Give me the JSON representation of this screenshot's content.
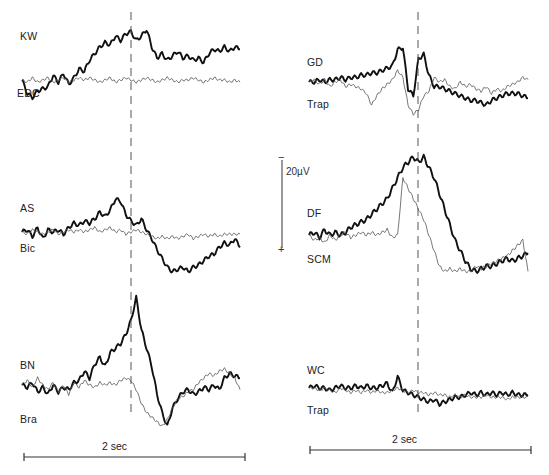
{
  "chart_data": {
    "type": "line",
    "title": "",
    "scale_bar": {
      "amplitude_label": "20µV",
      "polarity_top": "−",
      "polarity_bottom": "+",
      "time_label": "2 sec",
      "time_seconds": 2
    },
    "panels": [
      {
        "column": "left",
        "subject": "KW",
        "reference": "EDC",
        "series": [
          {
            "name": "KW",
            "style": "thick",
            "values": [
              0,
              -6,
              -8,
              -5,
              -4,
              -3,
              2,
              -1,
              3,
              -2,
              1,
              5,
              4,
              9,
              12,
              15,
              17,
              16,
              20,
              18,
              21,
              22,
              18,
              20,
              23,
              15,
              10,
              12,
              9,
              11,
              13,
              10,
              11,
              9,
              10,
              8,
              12,
              14,
              13,
              15,
              13,
              15,
              14
            ]
          },
          {
            "name": "EDC",
            "style": "thin",
            "values": [
              0,
              -1,
              1,
              -1,
              0,
              1,
              -1,
              0,
              1,
              -1,
              0,
              1,
              0,
              1,
              0,
              -1,
              0,
              1,
              -1,
              0,
              1,
              0,
              -1,
              0,
              1,
              0,
              -1,
              0,
              1,
              0,
              -1,
              0,
              0,
              1,
              0,
              -1,
              0,
              1,
              0,
              0,
              -1,
              0,
              -1
            ]
          }
        ]
      },
      {
        "column": "left",
        "subject": "AS",
        "reference": "Bic",
        "series": [
          {
            "name": "AS",
            "style": "thick",
            "values": [
              0,
              1,
              -2,
              2,
              -3,
              1,
              0,
              1,
              -1,
              2,
              4,
              3,
              5,
              4,
              6,
              9,
              7,
              10,
              15,
              14,
              8,
              5,
              3,
              6,
              1,
              -3,
              -8,
              -12,
              -16,
              -18,
              -17,
              -16,
              -18,
              -16,
              -15,
              -13,
              -11,
              -10,
              -7,
              -5,
              -6,
              -3,
              -7
            ]
          },
          {
            "name": "Bic",
            "style": "thin",
            "values": [
              0,
              -1,
              1,
              0,
              -1,
              0,
              1,
              -1,
              0,
              1,
              0,
              1,
              0,
              1,
              2,
              0,
              1,
              2,
              0,
              1,
              -1,
              0,
              1,
              0,
              -1,
              -2,
              -3,
              -2,
              -3,
              -2,
              -3,
              -2,
              -1,
              -3,
              -2,
              -1,
              -2,
              -1,
              -2,
              -1,
              -1,
              -1,
              -1
            ]
          }
        ]
      },
      {
        "column": "left",
        "subject": "BN",
        "reference": "Bra",
        "series": [
          {
            "name": "BN",
            "style": "thick",
            "values": [
              0,
              -1,
              1,
              -3,
              -1,
              -4,
              0,
              -3,
              -1,
              -2,
              1,
              2,
              6,
              3,
              9,
              12,
              8,
              14,
              16,
              18,
              22,
              28,
              38,
              24,
              16,
              8,
              -4,
              -12,
              -18,
              -10,
              -6,
              -3,
              -2,
              -4,
              -3,
              -1,
              -2,
              0,
              -2,
              3,
              5,
              4,
              3
            ]
          },
          {
            "name": "Bra",
            "style": "thin",
            "values": [
              0,
              2,
              -1,
              3,
              0,
              -2,
              1,
              -3,
              0,
              -4,
              1,
              -1,
              2,
              0,
              -1,
              1,
              0,
              1,
              0,
              2,
              3,
              2,
              -2,
              -8,
              -12,
              -14,
              -16,
              -18,
              -15,
              -10,
              -6,
              -5,
              -3,
              -2,
              1,
              3,
              5,
              4,
              6,
              7,
              5,
              3,
              -2
            ]
          }
        ]
      },
      {
        "column": "right",
        "subject": "GD",
        "reference": "Trap",
        "series": [
          {
            "name": "GD",
            "style": "thick",
            "values": [
              0,
              0,
              1,
              0,
              1,
              1,
              2,
              1,
              2,
              2,
              3,
              3,
              4,
              4,
              5,
              6,
              7,
              14,
              15,
              -3,
              -6,
              10,
              12,
              3,
              -2,
              -2,
              -3,
              -4,
              -5,
              -6,
              -7,
              -8,
              -8,
              -9,
              -10,
              -8,
              -7,
              -6,
              -5,
              -5,
              -5,
              -6,
              -7
            ]
          },
          {
            "name": "Trap",
            "style": "thin",
            "values": [
              0,
              1,
              -1,
              1,
              -2,
              0,
              1,
              -2,
              -1,
              -2,
              -3,
              -5,
              -10,
              -6,
              -3,
              -1,
              1,
              5,
              2,
              -10,
              -14,
              -12,
              -6,
              -4,
              2,
              0,
              1,
              -2,
              -3,
              0,
              -2,
              -1,
              -3,
              -4,
              -2,
              -5,
              -3,
              -4,
              -2,
              -1,
              0,
              2,
              1
            ]
          }
        ]
      },
      {
        "column": "right",
        "subject": "DF",
        "reference": "SCM",
        "series": [
          {
            "name": "DF",
            "style": "thick",
            "values": [
              0,
              1,
              -1,
              2,
              0,
              1,
              0,
              1,
              3,
              4,
              5,
              6,
              8,
              10,
              12,
              14,
              18,
              22,
              26,
              28,
              30,
              28,
              30,
              26,
              22,
              16,
              10,
              4,
              -2,
              -6,
              -10,
              -13,
              -14,
              -13,
              -12,
              -12,
              -11,
              -10,
              -9,
              -10,
              -9,
              -8,
              -7
            ]
          },
          {
            "name": "SCM",
            "style": "thin",
            "values": [
              0,
              -2,
              -1,
              -3,
              0,
              -2,
              0,
              1,
              -1,
              0,
              1,
              0,
              1,
              0,
              1,
              2,
              -1,
              0,
              22,
              18,
              14,
              10,
              6,
              0,
              -6,
              -12,
              -14,
              -13,
              -14,
              -13,
              -14,
              -14,
              -12,
              -13,
              -12,
              -11,
              -10,
              -9,
              -8,
              -6,
              -4,
              -2,
              -14
            ]
          }
        ]
      },
      {
        "column": "right",
        "subject": "WC",
        "reference": "Trap",
        "series": [
          {
            "name": "WC",
            "style": "thick",
            "values": [
              0,
              1,
              0,
              0,
              -1,
              0,
              1,
              0,
              0,
              1,
              0,
              1,
              0,
              0,
              1,
              2,
              -2,
              5,
              -1,
              -2,
              -3,
              -4,
              -5,
              -6,
              -5,
              -7,
              -6,
              -5,
              -4,
              -4,
              -3,
              -2,
              -3,
              -2,
              -3,
              -2,
              -3,
              -2,
              -3,
              -2,
              -3,
              -3,
              -3
            ]
          },
          {
            "name": "Trap",
            "style": "thin",
            "values": [
              0,
              0,
              -1,
              0,
              -1,
              -2,
              0,
              -1,
              -2,
              -1,
              -2,
              -1,
              -2,
              -1,
              -2,
              -2,
              -1,
              0,
              -1,
              -2,
              -1,
              -2,
              -2,
              -3,
              -2,
              -3,
              -3,
              -4,
              -3,
              -4,
              -3,
              -4,
              -4,
              -4,
              -3,
              -4,
              -4,
              -4,
              -5,
              -4,
              -4,
              -4,
              -4
            ]
          }
        ]
      }
    ],
    "trigger_marker": "dashed vertical line",
    "xlabel": "",
    "ylabel": ""
  },
  "labels": {
    "kw": "KW",
    "edc": "EDC",
    "as": "AS",
    "bic": "Bic",
    "bn": "BN",
    "bra": "Bra",
    "gd": "GD",
    "trap1": "Trap",
    "df": "DF",
    "scm": "SCM",
    "wc": "WC",
    "trap2": "Trap",
    "scale_amp": "20µV",
    "scale_minus": "−",
    "scale_plus": "+",
    "time_left": "2 sec",
    "time_right": "2 sec"
  }
}
